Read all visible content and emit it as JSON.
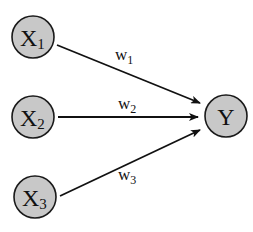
{
  "diagram": {
    "type": "perceptron-graph",
    "colors": {
      "node_fill": "#c8c8c8",
      "stroke": "#111111",
      "background": "#ffffff"
    },
    "inputs": [
      {
        "id": "x1",
        "symbol": "X",
        "subscript": "1"
      },
      {
        "id": "x2",
        "symbol": "X",
        "subscript": "2"
      },
      {
        "id": "x3",
        "symbol": "X",
        "subscript": "3"
      }
    ],
    "output": {
      "id": "y",
      "symbol": "Y"
    },
    "edges": [
      {
        "from": "x1",
        "to": "y",
        "weight_symbol": "w",
        "weight_subscript": "1"
      },
      {
        "from": "x2",
        "to": "y",
        "weight_symbol": "w",
        "weight_subscript": "2"
      },
      {
        "from": "x3",
        "to": "y",
        "weight_symbol": "w",
        "weight_subscript": "3"
      }
    ]
  }
}
